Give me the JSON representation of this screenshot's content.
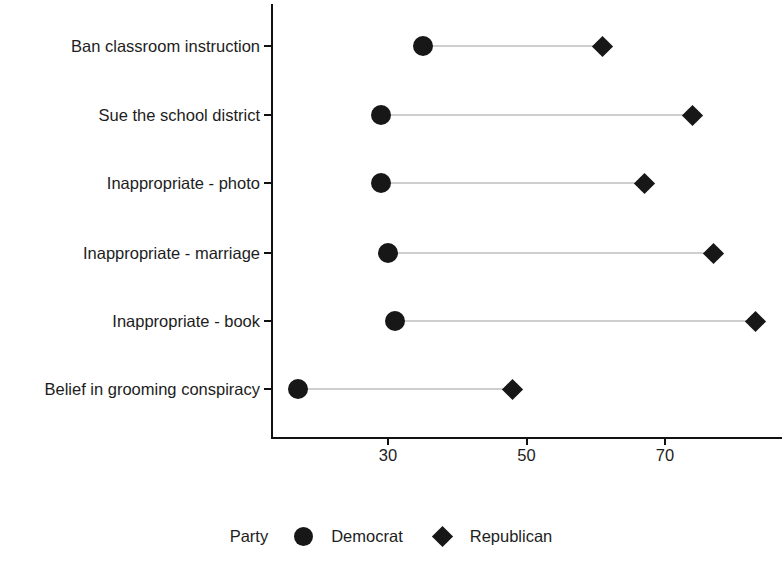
{
  "chart_data": {
    "type": "scatter",
    "subtype": "dumbbell",
    "title": "",
    "subtitle": "",
    "xlabel": "",
    "ylabel": "",
    "grid": false,
    "legend_position": "bottom",
    "legend_title": "Party",
    "xlim": [
      13,
      85
    ],
    "x_ticks": [
      30,
      50,
      70
    ],
    "x_tick_labels": [
      "30",
      "50",
      "70"
    ],
    "categories": [
      "Ban classroom instruction",
      "Sue the school district",
      "Inappropriate - photo",
      "Inappropriate - marriage",
      "Inappropriate - book",
      "Belief in grooming conspiracy"
    ],
    "series": [
      {
        "name": "Democrat",
        "marker": "circle",
        "color": "#171717",
        "values": [
          35,
          29,
          29,
          30,
          31,
          17
        ]
      },
      {
        "name": "Republican",
        "marker": "diamond",
        "color": "#171717",
        "values": [
          61,
          74,
          67,
          77,
          83,
          48
        ]
      }
    ],
    "connector_color": "#cfcfcf",
    "axis_color": "#111111"
  },
  "legend": {
    "title": "Party",
    "entries": [
      {
        "label": "Democrat",
        "marker": "circle"
      },
      {
        "label": "Republican",
        "marker": "diamond"
      }
    ]
  }
}
